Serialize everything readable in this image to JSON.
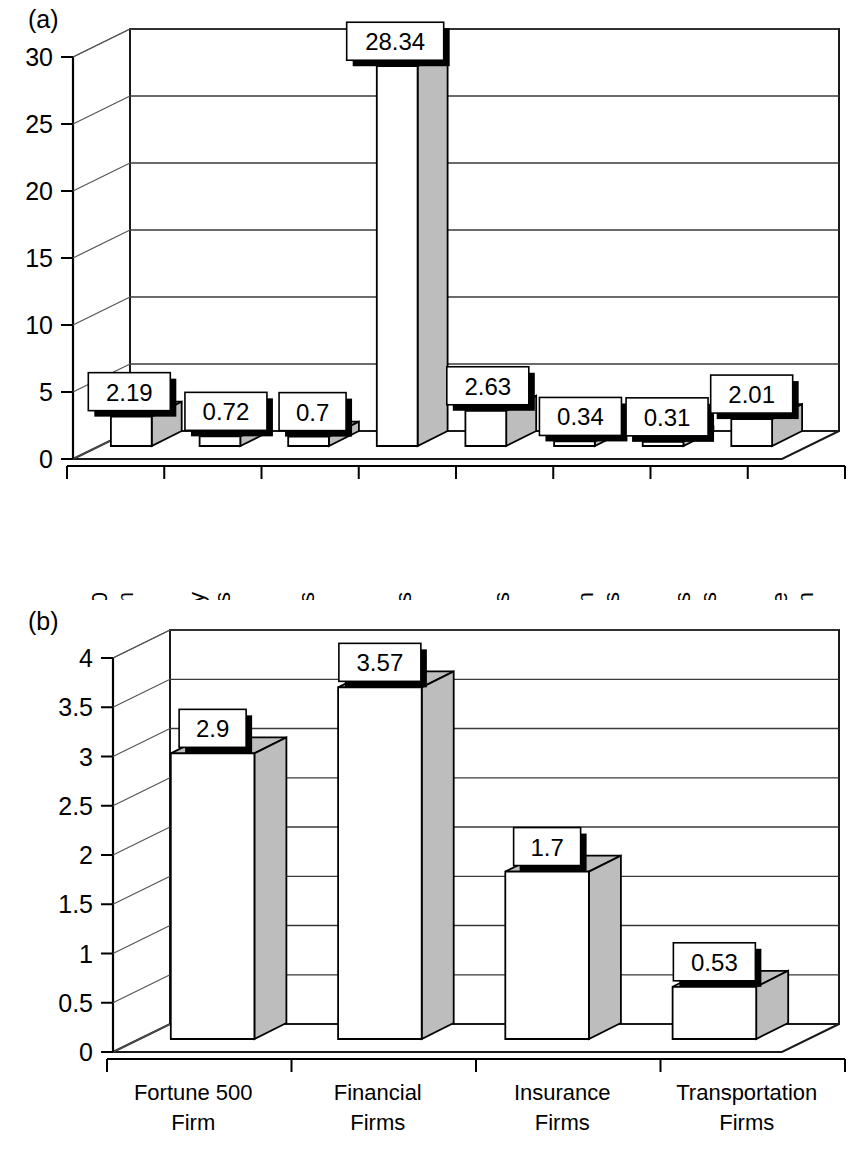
{
  "figure": {
    "panels": [
      {
        "id": "a",
        "letter": "(a)",
        "axis_line_color": "#000000"
      },
      {
        "id": "b",
        "letter": "(b)",
        "axis_line_color": "#000000"
      }
    ]
  },
  "chart_data": [
    {
      "type": "bar",
      "panel": "(a)",
      "title": "",
      "xlabel": "",
      "ylabel": "",
      "categories": [
        "Fortune 500 Firm",
        "High-Technology Firms",
        "Utilities Firms",
        "Financial Firms",
        "Insurance Firms",
        "Transportation Firms",
        "Communications Firms",
        "Southern State Location"
      ],
      "category_lines": [
        [
          "Fortune 500",
          "Firm"
        ],
        [
          "High-Technology",
          "Firms"
        ],
        [
          "Utilities Firms"
        ],
        [
          "Financial Firms"
        ],
        [
          "Insurance Firms"
        ],
        [
          "Transportation",
          "Firms"
        ],
        [
          "Communications",
          "Firms"
        ],
        [
          "Southern State",
          "Location"
        ]
      ],
      "values": [
        2.19,
        0.72,
        0.7,
        28.34,
        2.63,
        0.34,
        0.31,
        2.01
      ],
      "value_labels": [
        "2.19",
        "0.72",
        "0.7",
        "28.34",
        "2.63",
        "0.34",
        "0.31",
        "2.01"
      ],
      "yticks": [
        0,
        5,
        10,
        15,
        20,
        25,
        30
      ],
      "ytick_labels": [
        "0",
        "5",
        "10",
        "15",
        "20",
        "25",
        "30"
      ],
      "ylim": [
        0,
        30
      ],
      "grid": true,
      "legend": "none",
      "style": "3d-column"
    },
    {
      "type": "bar",
      "panel": "(b)",
      "title": "",
      "xlabel": "",
      "ylabel": "",
      "categories": [
        "Fortune 500 Firm",
        "Financial Firms",
        "Insurance Firms",
        "Transportation Firms"
      ],
      "category_lines": [
        [
          "Fortune 500",
          "Firm"
        ],
        [
          "Financial",
          "Firms"
        ],
        [
          "Insurance",
          "Firms"
        ],
        [
          "Transportation",
          "Firms"
        ]
      ],
      "values": [
        2.9,
        3.57,
        1.7,
        0.53
      ],
      "value_labels": [
        "2.9",
        "3.57",
        "1.7",
        "0.53"
      ],
      "yticks": [
        0,
        0.5,
        1,
        1.5,
        2,
        2.5,
        3,
        3.5,
        4
      ],
      "ytick_labels": [
        "0",
        "0.5",
        "1",
        "1.5",
        "2",
        "2.5",
        "3",
        "3.5",
        "4"
      ],
      "ylim": [
        0,
        4
      ],
      "grid": true,
      "legend": "none",
      "style": "3d-column"
    }
  ],
  "colors": {
    "bar_front": "#ffffff",
    "bar_shade": "#bdbdbd",
    "outline": "#000000",
    "grid": "#3a3a3a",
    "background": "#ffffff"
  }
}
